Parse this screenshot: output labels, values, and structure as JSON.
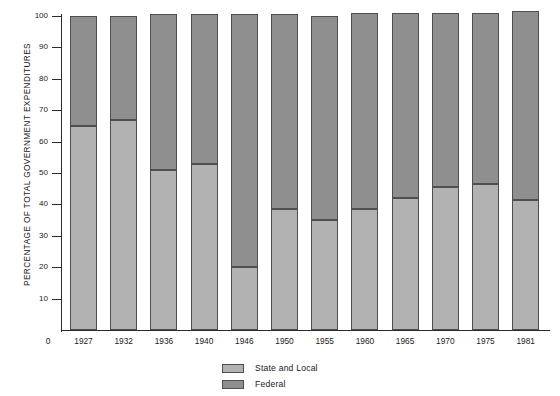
{
  "chart_data": {
    "type": "bar",
    "title": "",
    "subtitle": "",
    "stacked": true,
    "stack_total": 100,
    "xlabel": "",
    "ylabel": "PERCENTAGE OF TOTAL GOVERNMENT EXPENDITURES",
    "categories": [
      "1927",
      "1932",
      "1936",
      "1940",
      "1946",
      "1950",
      "1955",
      "1960",
      "1965",
      "1970",
      "1975",
      "1981"
    ],
    "series": [
      {
        "name": "State and Local",
        "color": "#b2b2b2",
        "values": [
          65,
          67,
          51,
          53,
          20,
          38.5,
          35,
          38.5,
          42,
          45.5,
          46.5,
          41.5
        ]
      },
      {
        "name": "Federal",
        "color": "#8f8f8f",
        "values": [
          35,
          33,
          49,
          47,
          80,
          62,
          65,
          62.5,
          59,
          55.5,
          54.5,
          60
        ]
      }
    ],
    "bar_totals": [
      100,
      100,
      100.5,
      100.5,
      100.5,
      100.5,
      100,
      101,
      101,
      101,
      101,
      101.5
    ],
    "ylim": [
      0,
      100
    ],
    "yticks": [
      0,
      10,
      20,
      30,
      40,
      50,
      60,
      70,
      80,
      90,
      100
    ],
    "ytick_labels": [
      "0",
      "10",
      "20",
      "30",
      "40",
      "50",
      "60",
      "70",
      "80",
      "90",
      "100"
    ],
    "grid": false,
    "legend_position": "bottom-center",
    "legend_entries": [
      "State and Local",
      "Federal"
    ]
  },
  "axes": {
    "y_title": "PERCENTAGE OF TOTAL GOVERNMENT EXPENDITURES",
    "x_zero_label": "0"
  },
  "legend": {
    "items": [
      {
        "label": "State and Local",
        "swatch": "state"
      },
      {
        "label": "Federal",
        "swatch": "federal"
      }
    ]
  },
  "colors": {
    "state_and_local": "#b2b2b2",
    "federal": "#8f8f8f",
    "axis": "#2b2b2b",
    "outline": "#4f4f4f",
    "background": "#ffffff"
  }
}
